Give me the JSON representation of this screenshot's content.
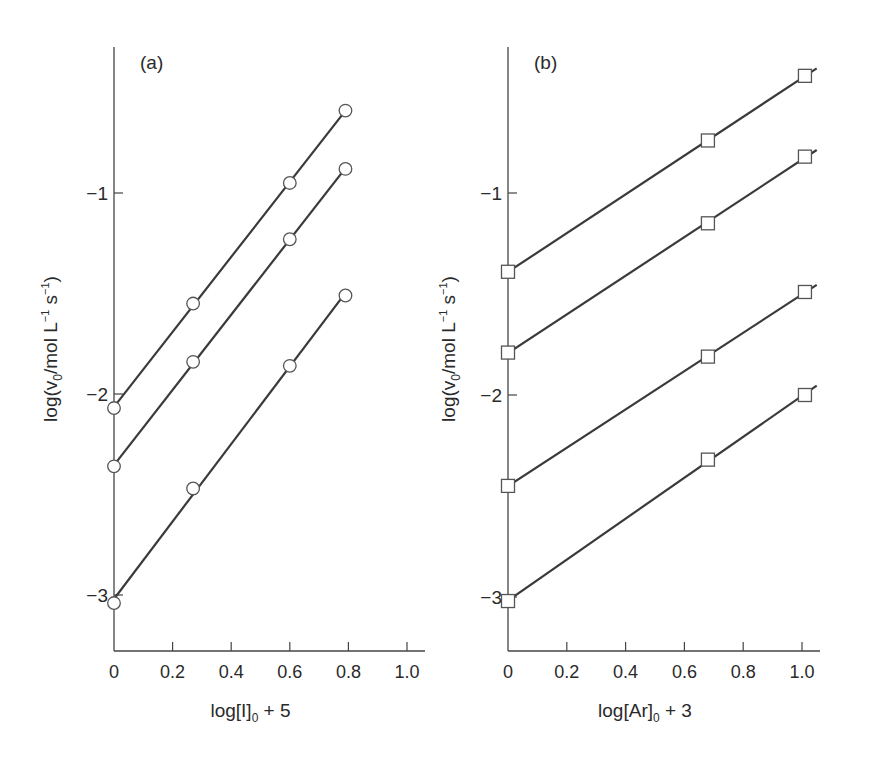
{
  "chart_data": [
    {
      "type": "line",
      "panel_label": "(a)",
      "xlabel": "log[I]₀ + 5",
      "xlabel_main": "log[I]",
      "xlabel_sub": "0",
      "xlabel_tail": " + 5",
      "ylabel_pre": "log(v",
      "ylabel_sub": "0",
      "ylabel_mid": "/mol L",
      "ylabel_sup1": "−1",
      "ylabel_s": " s",
      "ylabel_sup2": "−1",
      "ylabel_end": ")",
      "xlim": [
        0,
        1.05
      ],
      "ylim": [
        -3.28,
        -0.27
      ],
      "xticks": [
        0,
        0.2,
        0.4,
        0.6,
        0.8,
        1.0
      ],
      "xtick_labels": [
        "0",
        "0.2",
        "0.4",
        "0.6",
        "0.8",
        "1.0"
      ],
      "yticks": [
        -1,
        -2,
        -3
      ],
      "ytick_labels": [
        "−1",
        "−2",
        "−3"
      ],
      "grid": false,
      "marker": "circle",
      "series": [
        {
          "name": "series-1",
          "x": [
            0,
            0.27,
            0.6,
            0.79
          ],
          "y": [
            -2.07,
            -1.55,
            -0.95,
            -0.59
          ]
        },
        {
          "name": "series-2",
          "x": [
            0,
            0.27,
            0.6,
            0.79
          ],
          "y": [
            -2.36,
            -1.84,
            -1.23,
            -0.88
          ]
        },
        {
          "name": "series-3",
          "x": [
            0,
            0.27,
            0.6,
            0.79
          ],
          "y": [
            -3.04,
            -2.47,
            -1.86,
            -1.51
          ]
        }
      ]
    },
    {
      "type": "line",
      "panel_label": "(b)",
      "xlabel": "log[Ar]₀ + 3",
      "xlabel_main": "log[Ar]",
      "xlabel_sub": "0",
      "xlabel_tail": " + 3",
      "ylabel_pre": "log(v",
      "ylabel_sub": "0",
      "ylabel_mid": "/mol L",
      "ylabel_sup1": "−1",
      "ylabel_s": " s",
      "ylabel_sup2": "−1",
      "ylabel_end": ")",
      "xlim": [
        0,
        1.06
      ],
      "ylim": [
        -3.27,
        -0.27
      ],
      "xticks": [
        0,
        0.2,
        0.4,
        0.6,
        0.8,
        1.0
      ],
      "xtick_labels": [
        "0",
        "0.2",
        "0.4",
        "0.6",
        "0.8",
        "1.0"
      ],
      "yticks": [
        -1,
        -2,
        -3
      ],
      "ytick_labels": [
        "−1",
        "−2",
        "−3"
      ],
      "grid": false,
      "marker": "square",
      "series": [
        {
          "name": "series-1",
          "x": [
            0,
            0.68,
            1.01
          ],
          "y": [
            -1.39,
            -0.74,
            -0.42
          ]
        },
        {
          "name": "series-2",
          "x": [
            0,
            0.68,
            1.01
          ],
          "y": [
            -1.79,
            -1.15,
            -0.82
          ]
        },
        {
          "name": "series-3",
          "x": [
            0,
            0.68,
            1.01
          ],
          "y": [
            -2.45,
            -1.81,
            -1.49
          ]
        },
        {
          "name": "series-4",
          "x": [
            0,
            0.68,
            1.01
          ],
          "y": [
            -3.02,
            -2.32,
            -2.0
          ]
        }
      ]
    }
  ],
  "layout": {
    "panels": [
      {
        "x0": 114,
        "xpu": 293,
        "y_m1": 193,
        "ypu": 201,
        "axis_top": 47,
        "axis_bottom": 651,
        "axis_right": 425,
        "label_x": 140,
        "label_y": 63,
        "ylabel_x": 50,
        "line_extend": 0
      },
      {
        "x0": 508,
        "xpu": 294,
        "y_m1": 193,
        "ypu": 202,
        "axis_top": 47,
        "axis_bottom": 651,
        "axis_right": 820,
        "label_x": 534,
        "label_y": 63,
        "ylabel_x": 448,
        "line_extend": 0.04
      }
    ],
    "line_color": "#3a3a3a",
    "marker_stroke": "#555555"
  }
}
